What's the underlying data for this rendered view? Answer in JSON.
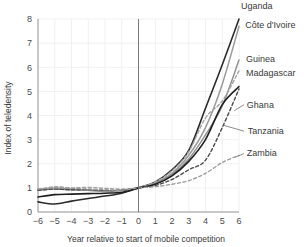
{
  "chart_data": {
    "type": "line",
    "title": "",
    "xlabel": "Year relative to start of mobile competition",
    "ylabel": "Index of teledensity",
    "xlim": [
      -6,
      6
    ],
    "ylim": [
      0,
      8
    ],
    "xticks": [
      "−6",
      "−5",
      "−4",
      "−3",
      "−2",
      "−1",
      "0",
      "1",
      "2",
      "3",
      "4",
      "5",
      "6"
    ],
    "yticks": [
      "0",
      "1",
      "2",
      "3",
      "4",
      "5",
      "6",
      "7",
      "8"
    ],
    "grid": true,
    "legend_position": "inline-right-labels",
    "reference_line_x": 0,
    "x": [
      -6,
      -5,
      -4,
      -3,
      -2,
      -1,
      0,
      1,
      2,
      3,
      4,
      5,
      6
    ],
    "series": [
      {
        "name": "Uganda",
        "label": "Uganda",
        "style": "solid",
        "color": "#2b2b2b",
        "width": 1.6,
        "values": [
          0.42,
          0.33,
          0.45,
          0.56,
          0.66,
          0.78,
          1.0,
          1.25,
          1.75,
          2.55,
          4.3,
          6.1,
          8.0
        ],
        "label_x": 6.0,
        "label_y": 8.55
      },
      {
        "name": "Cote d'Ivoire",
        "label": "Côte d'Ivoire",
        "style": "solid",
        "color": "#9a9a9a",
        "width": 1.5,
        "values": [
          0.95,
          1.0,
          0.95,
          0.9,
          0.85,
          0.9,
          1.0,
          1.2,
          1.6,
          2.35,
          3.5,
          5.3,
          7.7
        ],
        "label_x": 6.25,
        "label_y": 7.75
      },
      {
        "name": "Guinea",
        "label": "Guinea",
        "style": "solid",
        "color": "#8d8d8d",
        "width": 1.4,
        "values": [
          0.9,
          0.95,
          0.92,
          0.9,
          0.88,
          0.9,
          1.0,
          1.2,
          1.55,
          2.2,
          3.2,
          4.4,
          6.3
        ],
        "label_x": 6.3,
        "label_y": 6.35
      },
      {
        "name": "Madagascar",
        "label": "Madagascar",
        "style": "dashed",
        "color": "#a3a3a3",
        "width": 1.4,
        "values": [
          0.92,
          1.05,
          1.0,
          1.02,
          0.98,
          0.95,
          1.0,
          1.25,
          1.7,
          2.5,
          3.9,
          4.6,
          5.85
        ],
        "label_x": 6.3,
        "label_y": 5.75
      },
      {
        "name": "Ghana",
        "label": "Ghana",
        "style": "dashed",
        "color": "#4a4a4a",
        "width": 1.4,
        "values": [
          0.9,
          0.95,
          0.92,
          0.93,
          0.9,
          0.9,
          1.0,
          1.1,
          1.35,
          1.75,
          2.15,
          3.5,
          5.1
        ],
        "label_x": 6.35,
        "label_y": 4.45
      },
      {
        "name": "Tanzania",
        "label": "Tanzania",
        "style": "solid",
        "color": "#1f1f1f",
        "width": 1.6,
        "values": [
          0.62,
          0.72,
          0.74,
          0.76,
          0.78,
          0.82,
          1.0,
          1.15,
          1.5,
          2.1,
          3.0,
          4.45,
          5.2
        ],
        "label_x": 6.4,
        "label_y": 3.35
      },
      {
        "name": "Zambia",
        "label": "Zambia",
        "style": "dashed",
        "color": "#9c9c9c",
        "width": 1.3,
        "values": [
          0.95,
          1.0,
          0.98,
          0.95,
          0.92,
          0.9,
          1.0,
          1.05,
          1.15,
          1.3,
          1.6,
          2.05,
          2.35
        ],
        "label_x": 6.35,
        "label_y": 2.45
      }
    ],
    "leader_lines": [
      {
        "name": "ghana-leader",
        "x1": 5.72,
        "y1": 4.2,
        "x2": 6.3,
        "y2": 4.45
      },
      {
        "name": "tanzania-leader",
        "x1": 5.05,
        "y1": 3.6,
        "x2": 6.3,
        "y2": 3.35
      },
      {
        "name": "zambia-leader",
        "x1": 5.8,
        "y1": 2.28,
        "x2": 6.3,
        "y2": 2.42
      }
    ],
    "colors": {
      "plot_background": "#ffffff",
      "grid": "#f0f0f0",
      "axis": "#8c8c8c",
      "reference_line": "#7a7a7a",
      "text": "#3a3a3a"
    }
  }
}
